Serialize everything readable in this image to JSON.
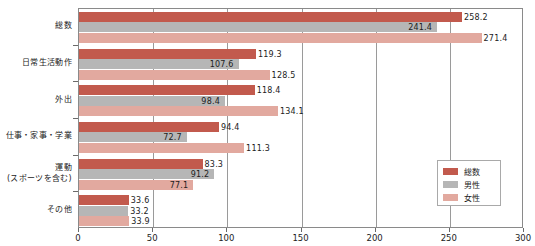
{
  "chart_data": {
    "type": "bar",
    "orientation": "horizontal",
    "title": "",
    "subtitle": "",
    "xlabel": "",
    "ylabel": "",
    "xlim": [
      0,
      300
    ],
    "xticks": [
      0,
      50,
      100,
      150,
      200,
      250,
      300
    ],
    "xtick_labels": [
      "0",
      "50",
      "100",
      "150",
      "200",
      "250",
      "300"
    ],
    "grid": true,
    "grid_axis": "x",
    "legend_position": "bottom-right",
    "categories": [
      "総数",
      "日常生活動作",
      "外出",
      "仕事・家事・学業",
      "運動\n(スポーツを含む)",
      "その他"
    ],
    "category_lines": [
      [
        "総数"
      ],
      [
        "日常生活動作"
      ],
      [
        "外出"
      ],
      [
        "仕事・家事・学業"
      ],
      [
        "運動",
        "(スポーツを含む)"
      ],
      [
        "その他"
      ]
    ],
    "series": [
      {
        "name": "総数",
        "color": "#c25a4d",
        "values": [
          258.2,
          119.3,
          118.4,
          94.4,
          83.3,
          33.6
        ],
        "labels": [
          "258.2",
          "119.3",
          "118.4",
          "94.4",
          "83.3",
          "33.6"
        ]
      },
      {
        "name": "男性",
        "color": "#b6b6b6",
        "values": [
          241.4,
          107.6,
          98.4,
          72.7,
          91.2,
          33.2
        ],
        "labels": [
          "241.4",
          "107.6",
          "98.4",
          "72.7",
          "91.2",
          "33.2"
        ]
      },
      {
        "name": "女性",
        "color": "#e2a99f",
        "values": [
          271.4,
          128.5,
          134.1,
          111.3,
          77.1,
          33.9
        ],
        "labels": [
          "271.4",
          "128.5",
          "134.1",
          "111.3",
          "77.1",
          "33.9"
        ]
      }
    ],
    "label_placement": [
      [
        "outside",
        "inside-right",
        "outside"
      ],
      [
        "outside",
        "inside-right",
        "outside"
      ],
      [
        "outside",
        "inside-right",
        "outside"
      ],
      [
        "outside",
        "inside-right",
        "outside"
      ],
      [
        "outside",
        "inside-right",
        "inside-right"
      ],
      [
        "outside",
        "outside",
        "outside"
      ]
    ]
  },
  "legend": {
    "items": [
      {
        "label": "総数",
        "swatch": "total"
      },
      {
        "label": "男性",
        "swatch": "male"
      },
      {
        "label": "女性",
        "swatch": "female"
      }
    ]
  },
  "colors": {
    "total": "#c25a4d",
    "male": "#b6b6b6",
    "female": "#e2a99f",
    "axis": "#8a8a8a",
    "grid": "#9a9a9a",
    "text": "#1c1c1c",
    "background": "#ffffff"
  }
}
